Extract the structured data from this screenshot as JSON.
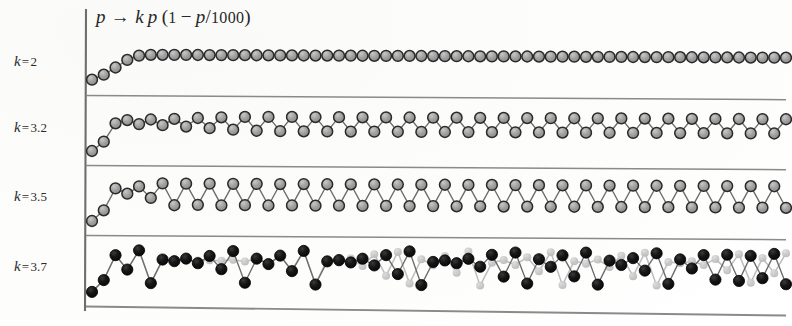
{
  "figure": {
    "title_parts": {
      "p1": "p",
      "arrow": "→",
      "k": "k",
      "p2": "p",
      "open": "(",
      "one": "1",
      "minus": "−",
      "p3": "p",
      "slash": "/",
      "thousand": "1000",
      "close": ")"
    },
    "panel_labels": [
      {
        "prefix": "k",
        "equals": "=",
        "value": "2"
      },
      {
        "prefix": "k",
        "equals": "=",
        "value": "3.2"
      },
      {
        "prefix": "k",
        "equals": "=",
        "value": "3.5"
      },
      {
        "prefix": "k",
        "equals": "=",
        "value": "3.7"
      }
    ],
    "colors": {
      "axis": "#6e6e6e",
      "separator": "#8a8a8a",
      "marker_gray_fill": "#9a9a9a",
      "marker_gray_stroke": "#2a2a2a",
      "marker_black_fill": "#111111",
      "marker_ghost_fill": "#c3c3c3",
      "connector": "#6b6b6b",
      "text": "#2b2b2b"
    }
  },
  "chart_data": {
    "type": "line",
    "xlabel": "",
    "ylabel": "",
    "grid": false,
    "legend_position": "none",
    "map_definition": "p_next = k * p * (1 - p / 1000)",
    "carrying_capacity": 1000,
    "iterations": 60,
    "panels": [
      {
        "label": "k = 2",
        "k": 2,
        "p0": 100,
        "behavior": "fixed point",
        "ylim": [
          0,
          1000
        ],
        "series": [
          {
            "name": "trajectory",
            "marker": "gray",
            "values": [
              100,
              180,
              295.2,
              416.1,
              485.9,
              499.6,
              500,
              500,
              500,
              500,
              500,
              500,
              500,
              500,
              500,
              500,
              500,
              500,
              500,
              500,
              500,
              500,
              500,
              500,
              500,
              500,
              500,
              500,
              500,
              500,
              500,
              500,
              500,
              500,
              500,
              500,
              500,
              500,
              500,
              500,
              500,
              500,
              500,
              500,
              500,
              500,
              500,
              500,
              500,
              500,
              500,
              500,
              500,
              500,
              500,
              500,
              500,
              500,
              500,
              500
            ]
          }
        ]
      },
      {
        "label": "k = 3.2",
        "k": 3.2,
        "p0": 100,
        "behavior": "period-2 cycle",
        "ylim": [
          0,
          1000
        ],
        "series": [
          {
            "name": "trajectory",
            "marker": "gray",
            "values": [
              100,
              288,
              656.3,
              721.6,
              642.6,
              735.1,
              623,
              751.7,
              597.2,
              770,
              566.6,
              785.6,
              538.9,
              795.4,
              520.6,
              798.5,
              514.6,
              799.2,
              513.2,
              799.3,
              512.9,
              799.4,
              512.8,
              799.4,
              512.8,
              799.4,
              512.8,
              799.4,
              512.8,
              799.4,
              512.8,
              799.4,
              512.8,
              799.4,
              512.8,
              799.4,
              512.8,
              799.4,
              512.8,
              799.4,
              512.8,
              799.4,
              512.8,
              799.4,
              512.8,
              799.4,
              512.8,
              799.4,
              512.8,
              799.4,
              512.8,
              799.4,
              512.8,
              799.4,
              512.8,
              799.4,
              512.8,
              799.4,
              512.8,
              799.4
            ]
          }
        ]
      },
      {
        "label": "k = 3.5",
        "k": 3.5,
        "p0": 100,
        "behavior": "period-4 cycle",
        "ylim": [
          0,
          1000
        ],
        "series": [
          {
            "name": "trajectory",
            "marker": "gray",
            "values": [
              100,
              315,
              754.2,
              648.9,
              796.8,
              566.7,
              859.4,
              423,
              855.6,
              432.6,
              858.7,
              424.8,
              856.2,
              431.1,
              858.3,
              425.9,
              856.6,
              430.2,
              858,
              426.6,
              856.9,
              429.7,
              857.9,
              426.9,
              857,
              429.4,
              857.8,
              427.1,
              857.1,
              429.2,
              857.7,
              427.2,
              857.1,
              429.1,
              857.6,
              427.3,
              857.2,
              429,
              857.6,
              427.4,
              857.2,
              429,
              857.6,
              427.4,
              857.2,
              429,
              857.6,
              427.4,
              857.2,
              429,
              857.6,
              427.4,
              857.2,
              429,
              857.6,
              427.4,
              857.2,
              429,
              857.6,
              427.4
            ]
          }
        ]
      },
      {
        "label": "k = 3.7",
        "k": 3.7,
        "p0_a": 100,
        "p0_b": 101,
        "behavior": "chaotic — two nearby initial values diverge",
        "ylim": [
          0,
          1000
        ],
        "series": [
          {
            "name": "trajectory-a",
            "marker": "black",
            "p0": 100,
            "values": [
              100,
              333,
              822.2,
              541.1,
              918.5,
              277,
              741,
              710.2,
              761.4,
              672,
              815.4,
              557.1,
              913.1,
              293.6,
              767.1,
              661.2,
              828.6,
              525.4,
              922.5,
              264.7,
              720.1,
              745.7,
              701.4,
              775.1,
              644.9,
              847.8,
              477.6,
              922.8,
              263.6,
              718.3,
              748.6,
              696.1,
              782.9,
              628.7,
              863.3,
              436.7,
              910.1,
              302.8,
              780.6,
              633.5,
              859,
              448.2,
              914.8,
              288.3,
              759.6,
              675.5,
              811.1,
              567.2,
              908,
              309.1,
              790.4,
              612.8,
              877.6,
              397.3,
              886,
              373.6,
              866.1,
              429.2,
              906.7,
              313
            ]
          },
          {
            "name": "trajectory-b",
            "marker": "ghost",
            "p0": 101,
            "values": [
              101,
              335.9,
              824.8,
              534.3,
              920.5,
              270.7,
              730.1,
              729.1,
              730.9,
              727.6,
              733.6,
              722.6,
              741.8,
              708.6,
              763.8,
              667.7,
              820.7,
              544.7,
              917.3,
              280.8,
              748.2,
              696.8,
              781.8,
              630.9,
              861.5,
              441.4,
              912.4,
              295.7,
              770.3,
              654.8,
              835,
              509.4,
              924.5,
              258.3,
              708.7,
              763.6,
              668.1,
              820.5,
              545.2,
              917.5,
              280.1,
              747,
              699,
              778.7,
              637.3,
              855.5,
              457.2,
              918.8,
              275.8,
              739.3,
              713.2,
              757,
              681.2,
              803.5,
              584.1,
              898.6,
              337.1,
              826.9,
              529.4,
              921.6
            ]
          }
        ]
      }
    ]
  }
}
